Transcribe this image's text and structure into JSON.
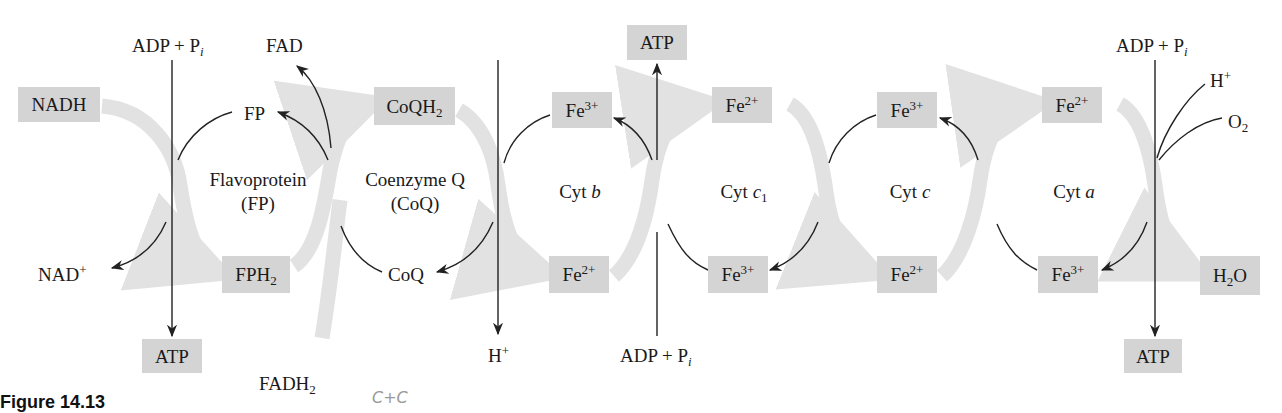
{
  "figure": {
    "caption": "Figure 14.13",
    "handwritten_note": "C+C",
    "colors": {
      "box_fill": "#d4d4d4",
      "flow_band": "#e2e2e2",
      "line": "#222222",
      "background": "#ffffff"
    }
  },
  "complexes": [
    {
      "id": "fp",
      "name": "Flavoprotein",
      "abbr": "(FP)"
    },
    {
      "id": "coq",
      "name": "Coenzyme Q",
      "abbr": "(CoQ)"
    },
    {
      "id": "cytb",
      "name": "Cyt",
      "italic": "b"
    },
    {
      "id": "cytc1",
      "name": "Cyt",
      "italic": "c",
      "sub": "1"
    },
    {
      "id": "cytc",
      "name": "Cyt",
      "italic": "c"
    },
    {
      "id": "cyta",
      "name": "Cyt",
      "italic": "a"
    }
  ],
  "boxes": {
    "nadh": "NADH",
    "atp1": "ATP",
    "fph2": {
      "base": "FPH",
      "sub": "2"
    },
    "coqh2": {
      "base": "CoQH",
      "sub": "2"
    },
    "cytb_fe3": {
      "base": "Fe",
      "sup": "3+"
    },
    "cytb_fe2": {
      "base": "Fe",
      "sup": "2+"
    },
    "atp2": "ATP",
    "cytc1_fe2": {
      "base": "Fe",
      "sup": "2+"
    },
    "cytc1_fe3": {
      "base": "Fe",
      "sup": "3+"
    },
    "cytc_fe3": {
      "base": "Fe",
      "sup": "3+"
    },
    "cytc_fe2": {
      "base": "Fe",
      "sup": "2+"
    },
    "cyta_fe2": {
      "base": "Fe",
      "sup": "2+"
    },
    "cyta_fe3": {
      "base": "Fe",
      "sup": "3+"
    },
    "h2o": {
      "h": "H",
      "sub": "2",
      "o": "O"
    },
    "atp3": "ATP"
  },
  "labels": {
    "adp1": {
      "text": "ADP + P",
      "italic": "i"
    },
    "fad": "FAD",
    "fp": "FP",
    "nad": {
      "base": "NAD",
      "sup": "+"
    },
    "fadh2": {
      "base": "FADH",
      "sub": "2"
    },
    "coq": "CoQ",
    "hplus1": {
      "base": "H",
      "sup": "+"
    },
    "adp2": {
      "text": "ADP + P",
      "italic": "i"
    },
    "adp3": {
      "text": "ADP + P",
      "italic": "i"
    },
    "hplus2": {
      "base": "H",
      "sup": "+"
    },
    "o2": {
      "base": "O",
      "sub": "2"
    }
  }
}
